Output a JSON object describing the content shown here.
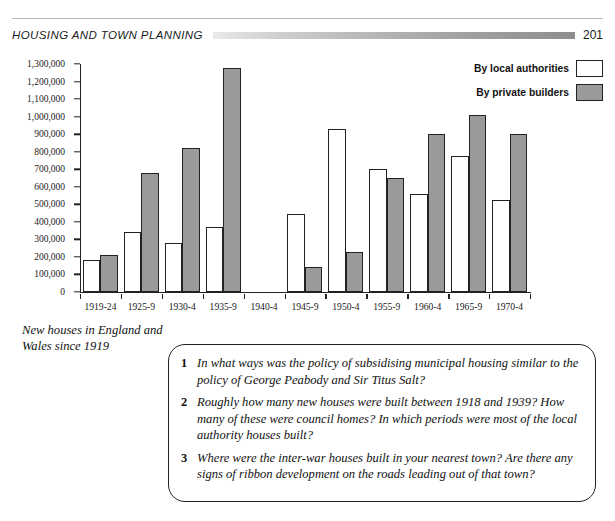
{
  "header": {
    "title": "HOUSING AND TOWN PLANNING",
    "page_number": "201"
  },
  "caption": "New houses in England and Wales since 1919",
  "legend": {
    "local_authorities": "By local authorities",
    "private_builders": "By private builders",
    "colors": {
      "local_authorities": "#ffffff",
      "private_builders": "#9a9a9a",
      "outline": "#222222"
    }
  },
  "chart_data": {
    "type": "bar",
    "title": "New houses in England and Wales since 1919",
    "xlabel": "",
    "ylabel": "",
    "ylim": [
      0,
      1300000
    ],
    "ytick_step": 100000,
    "grid": false,
    "legend_position": "top-right",
    "categories": [
      "1919-24",
      "1925-9",
      "1930-4",
      "1935-9",
      "1940-4",
      "1945-9",
      "1950-4",
      "1955-9",
      "1960-4",
      "1965-9",
      "1970-4"
    ],
    "ytick_labels": [
      "0",
      "100,000",
      "200,000",
      "300,000",
      "400,000",
      "500,000",
      "600,000",
      "700,000",
      "800,000",
      "900,000",
      "1,000,000",
      "1,100,000",
      "1,200,000",
      "1,300,000"
    ],
    "series": [
      {
        "name": "By local authorities",
        "color": "#ffffff",
        "values": [
          180000,
          345000,
          280000,
          370000,
          0,
          445000,
          930000,
          700000,
          560000,
          775000,
          525000
        ]
      },
      {
        "name": "By private builders",
        "color": "#9a9a9a",
        "values": [
          210000,
          680000,
          820000,
          1275000,
          0,
          145000,
          230000,
          650000,
          900000,
          1010000,
          900000
        ]
      }
    ]
  },
  "questions": [
    {
      "number": "1",
      "text": "In what ways was the policy of subsidising municipal housing similar to the policy of George Peabody and Sir Titus Salt?"
    },
    {
      "number": "2",
      "text": "Roughly how many new houses were built between 1918 and 1939? How many of these were council homes? In which periods were most of the local authority houses built?"
    },
    {
      "number": "3",
      "text": "Where were the inter-war houses built in your nearest town? Are there any signs of ribbon development on the roads leading out of that town?"
    }
  ]
}
